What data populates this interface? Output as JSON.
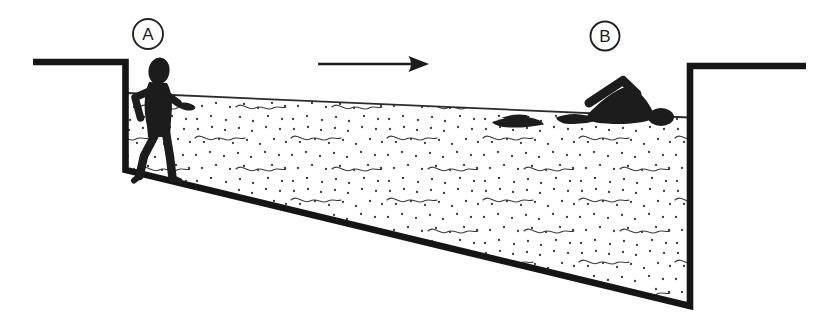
{
  "figure": {
    "kind": "pool-cross-section-diagram",
    "labels": {
      "point_a": "A",
      "point_b": "B"
    },
    "icons": {
      "direction_arrow": "arrow-right-icon",
      "left_figure": "person-wading-icon",
      "right_figure": "person-swimming-icon",
      "water_fill": "stipple-dots-and-wave-texture"
    },
    "colors": {
      "ink": "#1c1c1c",
      "texture": "#3a3a3a",
      "paper": "#ffffff"
    }
  }
}
